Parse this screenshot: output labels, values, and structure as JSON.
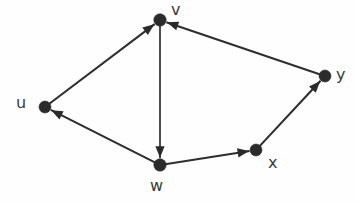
{
  "diagram": {
    "type": "directed-graph",
    "background_color": "#fefefe",
    "node_color": "#2b2b2b",
    "edge_color": "#2e2e2e",
    "label_color": "#3a3a3a",
    "nodes": [
      {
        "id": "u",
        "label": "u",
        "x": 45,
        "y": 107,
        "r": 6.0,
        "label_x": 16,
        "label_y": 95
      },
      {
        "id": "v",
        "label": "v",
        "x": 160,
        "y": 20,
        "r": 6.2,
        "label_x": 171,
        "label_y": 2
      },
      {
        "id": "w",
        "label": "w",
        "x": 160,
        "y": 165,
        "r": 6.2,
        "label_x": 150,
        "label_y": 178
      },
      {
        "id": "x",
        "label": "x",
        "x": 256,
        "y": 150,
        "r": 6.0,
        "label_x": 268,
        "label_y": 155
      },
      {
        "id": "y",
        "label": "y",
        "x": 325,
        "y": 76,
        "r": 6.0,
        "label_x": 336,
        "label_y": 67
      }
    ],
    "edges": [
      {
        "id": "u-v",
        "from": "u",
        "to": "v",
        "directed": true,
        "arrow_at": "v"
      },
      {
        "id": "v-w",
        "from": "v",
        "to": "w",
        "directed": true,
        "arrow_at": "w"
      },
      {
        "id": "w-u",
        "from": "w",
        "to": "u",
        "directed": true,
        "arrow_at": "u"
      },
      {
        "id": "w-x",
        "from": "w",
        "to": "x",
        "directed": true,
        "arrow_at": "x"
      },
      {
        "id": "x-y",
        "from": "x",
        "to": "y",
        "directed": true,
        "arrow_at": "y"
      },
      {
        "id": "y-v",
        "from": "y",
        "to": "v",
        "directed": true,
        "arrow_at": "v"
      }
    ]
  }
}
